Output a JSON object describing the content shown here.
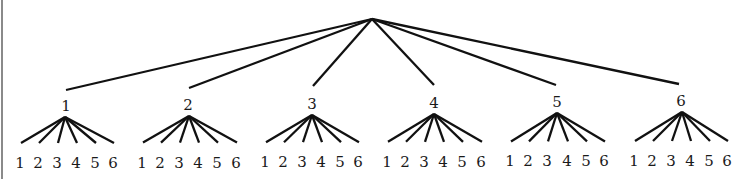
{
  "diagram": {
    "type": "tree",
    "colors": {
      "line": "#111111",
      "text": "#1a1a1a",
      "border": "#8a8a8a",
      "background": "#ffffff"
    },
    "root": {
      "x": 372,
      "y": 19
    },
    "level1": [
      {
        "label": "1",
        "edge_end": {
          "x": 66,
          "y": 90
        },
        "label_pos": {
          "x": 66,
          "y": 111
        },
        "apex": {
          "x": 65,
          "y": 117
        },
        "leaves": [
          {
            "label": "1",
            "x": 21
          },
          {
            "label": "2",
            "x": 39
          },
          {
            "label": "3",
            "x": 58
          },
          {
            "label": "4",
            "x": 77
          },
          {
            "label": "5",
            "x": 96
          },
          {
            "label": "6",
            "x": 114
          }
        ]
      },
      {
        "label": "2",
        "edge_end": {
          "x": 189,
          "y": 88
        },
        "label_pos": {
          "x": 188,
          "y": 110
        },
        "apex": {
          "x": 189,
          "y": 116
        },
        "leaves": [
          {
            "label": "1",
            "x": 143
          },
          {
            "label": "2",
            "x": 161
          },
          {
            "label": "3",
            "x": 180
          },
          {
            "label": "4",
            "x": 199
          },
          {
            "label": "5",
            "x": 218
          },
          {
            "label": "6",
            "x": 237
          }
        ]
      },
      {
        "label": "3",
        "edge_end": {
          "x": 313,
          "y": 86
        },
        "label_pos": {
          "x": 312,
          "y": 109
        },
        "apex": {
          "x": 312,
          "y": 115
        },
        "leaves": [
          {
            "label": "1",
            "x": 266
          },
          {
            "label": "2",
            "x": 284
          },
          {
            "label": "3",
            "x": 303
          },
          {
            "label": "4",
            "x": 322
          },
          {
            "label": "5",
            "x": 341
          },
          {
            "label": "6",
            "x": 359
          }
        ]
      },
      {
        "label": "4",
        "edge_end": {
          "x": 434,
          "y": 85
        },
        "label_pos": {
          "x": 434,
          "y": 108
        },
        "apex": {
          "x": 434,
          "y": 114
        },
        "leaves": [
          {
            "label": "1",
            "x": 388
          },
          {
            "label": "2",
            "x": 406
          },
          {
            "label": "3",
            "x": 425
          },
          {
            "label": "4",
            "x": 444
          },
          {
            "label": "5",
            "x": 463
          },
          {
            "label": "6",
            "x": 482
          }
        ]
      },
      {
        "label": "5",
        "edge_end": {
          "x": 556,
          "y": 85
        },
        "label_pos": {
          "x": 557,
          "y": 107
        },
        "apex": {
          "x": 557,
          "y": 113
        },
        "leaves": [
          {
            "label": "1",
            "x": 511
          },
          {
            "label": "2",
            "x": 529
          },
          {
            "label": "3",
            "x": 548
          },
          {
            "label": "4",
            "x": 568
          },
          {
            "label": "5",
            "x": 587
          },
          {
            "label": "6",
            "x": 605
          }
        ]
      },
      {
        "label": "6",
        "edge_end": {
          "x": 679,
          "y": 84
        },
        "label_pos": {
          "x": 681,
          "y": 106
        },
        "apex": {
          "x": 682,
          "y": 112
        },
        "leaves": [
          {
            "label": "1",
            "x": 635
          },
          {
            "label": "2",
            "x": 653
          },
          {
            "label": "3",
            "x": 672
          },
          {
            "label": "4",
            "x": 691
          },
          {
            "label": "5",
            "x": 710
          },
          {
            "label": "6",
            "x": 728
          }
        ]
      }
    ],
    "leaf_line_end_y": 143,
    "leaf_label_y": 168
  }
}
